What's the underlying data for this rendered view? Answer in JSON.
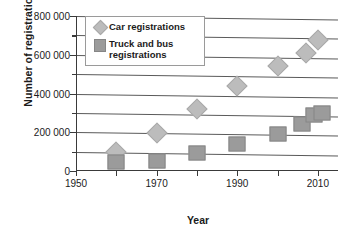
{
  "chart_data": {
    "type": "scatter",
    "title": "",
    "xlabel": "Year",
    "ylabel": "Number of registrations",
    "xlim": [
      1950,
      2015
    ],
    "ylim": [
      0,
      800000
    ],
    "xticks": [
      1950,
      1960,
      1970,
      1980,
      1990,
      2000,
      2010
    ],
    "xticklabels": [
      "1950",
      "",
      "1970",
      "",
      "1990",
      "",
      "2010"
    ],
    "yticks": [
      0,
      100000,
      200000,
      300000,
      400000,
      500000,
      600000,
      700000,
      800000
    ],
    "yticklabels": [
      "0",
      "",
      "200 000",
      "",
      "400 000",
      "",
      "600 000",
      "",
      "800 000"
    ],
    "grid": "horizontal",
    "legend_position": "top-left",
    "series": [
      {
        "name": "Car registrations",
        "marker": "diamond",
        "color": "#bcbcbc",
        "points": [
          {
            "x": 1960,
            "y": 100000
          },
          {
            "x": 1970,
            "y": 197000
          },
          {
            "x": 1980,
            "y": 320000
          },
          {
            "x": 1990,
            "y": 440000
          },
          {
            "x": 2000,
            "y": 540000
          },
          {
            "x": 2007,
            "y": 608000
          },
          {
            "x": 2010,
            "y": 675000
          }
        ]
      },
      {
        "name": "Truck and bus registrations",
        "marker": "square",
        "color": "#9b9b9b",
        "points": [
          {
            "x": 1960,
            "y": 47000
          },
          {
            "x": 1970,
            "y": 52000
          },
          {
            "x": 1980,
            "y": 95000
          },
          {
            "x": 1990,
            "y": 140000
          },
          {
            "x": 2000,
            "y": 193000
          },
          {
            "x": 2006,
            "y": 245000
          },
          {
            "x": 2009,
            "y": 288000
          },
          {
            "x": 2011,
            "y": 297000
          }
        ]
      }
    ]
  },
  "axes": {
    "x_title": "Year",
    "y_title": "Number of registrations"
  },
  "legend": {
    "items": [
      {
        "label": "Car registrations",
        "icon": "diamond-marker-icon"
      },
      {
        "label": "Truck and bus registrations",
        "icon": "square-marker-icon"
      }
    ]
  }
}
